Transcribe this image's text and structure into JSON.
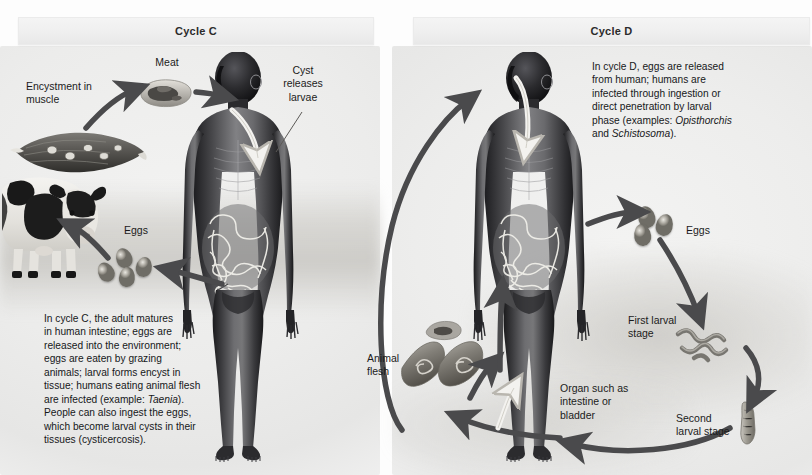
{
  "figure": {
    "kind": "parasite-life-cycle-diagram",
    "panels": [
      {
        "id": "cycle-c",
        "title": "Cycle C"
      },
      {
        "id": "cycle-d",
        "title": "Cycle D"
      }
    ]
  },
  "cycle_c": {
    "title": "Cycle C",
    "labels": {
      "encystment": "Encystment in\nmuscle",
      "encystment_line1": "Encystment in",
      "encystment_line2": "muscle",
      "meat": "Meat",
      "cyst_releases_larvae_line1": "Cyst",
      "cyst_releases_larvae_line2": "releases",
      "cyst_releases_larvae_line3": "larvae",
      "eggs": "Eggs"
    },
    "caption": "In cycle C, the adult matures in human intestine; eggs are released into the environment; eggs are eaten by grazing animals; larval forms encyst in tissue; humans eating animal flesh are infected (example: Taenia). People can also ingest the eggs, which become larval cysts in their tissues (cysticercosis).",
    "caption_lines": [
      "In cycle C, the adult matures",
      "in human intestine; eggs are",
      "released into the environment;",
      "eggs are eaten by grazing",
      "animals; larval forms encyst in",
      "tissue; humans eating animal flesh",
      "are infected (example: Taenia).",
      "People can also ingest the eggs,",
      "which become larval cysts in their",
      "tissues (cysticercosis)."
    ],
    "caption_italic_terms": [
      "Taenia"
    ],
    "organisms": [
      "human",
      "cow",
      "muscle cyst",
      "meat",
      "eggs"
    ]
  },
  "cycle_d": {
    "title": "Cycle D",
    "caption": "In cycle D, eggs are released from human; humans are infected through ingestion or direct penetration by larval phase (examples: Opisthorchis and Schistosoma).",
    "caption_lines": [
      "In cycle D, eggs are released",
      "from human; humans are",
      "infected through ingestion or",
      "direct penetration by larval",
      "phase (examples: Opisthorchis",
      "and Schistosoma)."
    ],
    "caption_italic_terms": [
      "Opisthorchis",
      "Schistosoma"
    ],
    "labels": {
      "eggs": "Eggs",
      "first_larval_stage_line1": "First larval",
      "first_larval_stage_line2": "stage",
      "second_larval_stage_line1": "Second",
      "second_larval_stage_line2": "larval stage",
      "organ_line1": "Organ such as",
      "organ_line2": "intestine or",
      "organ_line3": "bladder",
      "animal_flesh_line1": "Animal",
      "animal_flesh_line2": "flesh"
    },
    "organisms": [
      "human",
      "eggs",
      "first larval stage",
      "second larval stage",
      "animal flesh"
    ]
  },
  "colors": {
    "arrow_dark": "#4a4a4c",
    "arrow_outline_light": "#f2f2f0",
    "header_bar": "#efefef",
    "text": "#1b1b1b",
    "background": "#fdfdfd",
    "ground_shadow": "#bcbab4"
  }
}
